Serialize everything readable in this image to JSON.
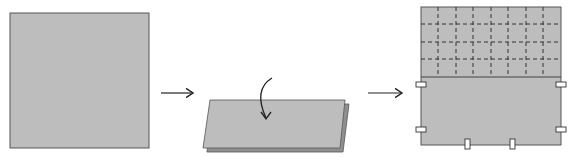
{
  "diagram": {
    "title": "",
    "steps": [
      {
        "id": "step-1",
        "label": "",
        "description": "flat square sheet"
      },
      {
        "id": "step-2",
        "label": "",
        "description": "sheet folded in half, fold-over arrow"
      },
      {
        "id": "step-3",
        "label": "",
        "description": "unfolded sheet with dashed grid on top half and tabs"
      }
    ],
    "colors": {
      "paper": "#bdbdbd",
      "paper_shadow": "#8f8f8f",
      "outline": "#555555",
      "ink": "#222222",
      "background": "#ffffff"
    },
    "grid": {
      "columns": 8,
      "rows": 4
    },
    "tabs_count": 6
  }
}
